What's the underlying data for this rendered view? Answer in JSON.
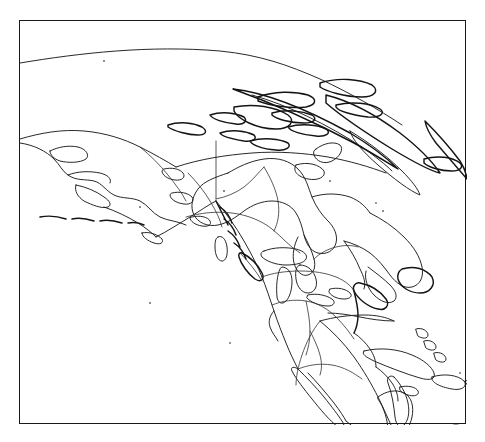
{
  "document": {
    "type": "outline-map",
    "title": "North America outline map",
    "description": "Black and white line-drawing outline map of North America in an oblique projection, enclosed in a thin rectangular border."
  },
  "frame": {
    "x": 19,
    "y": 20,
    "width": 447,
    "height": 404,
    "stroke_color": "#1a1a1a",
    "background_color": "#ffffff"
  },
  "style": {
    "line_color": "#1c1c1c",
    "border_color": "#303030",
    "page_background": "#ffffff",
    "fill": "none"
  },
  "map_content": {
    "projection_hint": "oblique / conic, north-polar tilt",
    "regions": [
      "Alaska",
      "Aleutian Islands",
      "Yukon",
      "British Columbia",
      "Vancouver Island",
      "Canadian Arctic Archipelago",
      "Greenland (west coast sliver)",
      "Baffin Island",
      "Hudson Bay",
      "James Bay",
      "Labrador",
      "Newfoundland",
      "Nova Scotia",
      "Great Lakes",
      "United States",
      "Baja California",
      "Gulf of Mexico",
      "Yucatan Peninsula",
      "Florida",
      "Cuba",
      "Hispaniola",
      "Puerto Rico",
      "Lesser Antilles",
      "Central America",
      "Northern South America"
    ],
    "features": [
      "coastlines",
      "internal regional boundaries",
      "island outlines",
      "lake outlines"
    ],
    "labels": [],
    "legend": null,
    "graticule": false,
    "scale_bar": null,
    "north_arrow": null
  }
}
